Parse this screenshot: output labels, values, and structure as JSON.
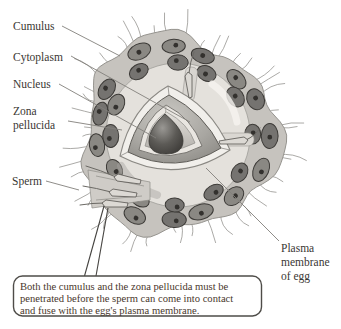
{
  "figure": {
    "labels": {
      "cumulus": "Cumulus",
      "cytoplasm": "Cytoplasm",
      "nucleus": "Nucleus",
      "zona_line1": "Zona",
      "zona_line2": "pellucida",
      "sperm": "Sperm",
      "plasma_line1": "Plasma",
      "plasma_line2": "membrane",
      "plasma_line3": "of egg"
    },
    "caption": {
      "line1": "Both the cumulus and the zona pellucida must be",
      "line2": "penetrated before the sperm can come into contact",
      "line3": "and fuse with the egg's plasma membrane."
    },
    "colors": {
      "background": "#ffffff",
      "label_text": "#3a3733",
      "caption_text": "#49372c",
      "caption_border": "#4e4c48",
      "caption_bg": "#ffffff",
      "leader_line": "#82807c",
      "pointer_line": "#44423f",
      "filament": "#8f8d89",
      "matrix": "#c6c3be",
      "matrix_edge": "#96948f",
      "zona": "#e4e1dc",
      "zona_edge": "#a09e99",
      "cell_fill": "#8a8883",
      "cell_fill_alt": "#757370",
      "cell_outline": "#3c3a37",
      "cell_nucleolus": "#33312e",
      "sperm_fill": "#dcd9d4",
      "sperm_outline": "#55534f",
      "sperm_tail": "#6b6964"
    }
  }
}
